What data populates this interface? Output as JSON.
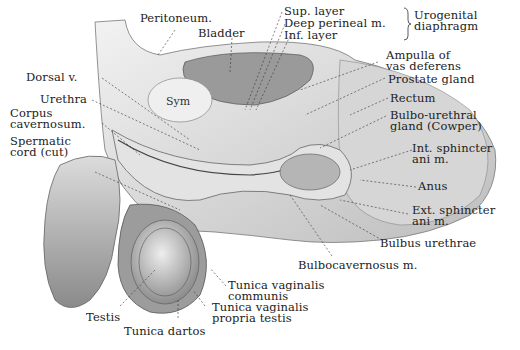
{
  "figure": {
    "labels": {
      "peritoneum": "Peritoneum.",
      "bladder": "Bladder",
      "sup_layer": "Sup. layer",
      "deep_perineal": "Deep perineal m.",
      "inf_layer": "Inf. layer",
      "urogenital_1": "Urogenital",
      "urogenital_2": "diaphragm",
      "ampulla_1": "Ampulla of",
      "ampulla_2": "vas deferens",
      "prostate": "Prostate gland",
      "rectum": "Rectum",
      "bulbo_1": "Bulbo-urethral",
      "bulbo_2": "gland (Cowper)",
      "int_sphincter_1": "Int. sphincter",
      "int_sphincter_2": "ani m.",
      "anus": "Anus",
      "ext_sphincter_1": "Ext. sphincter",
      "ext_sphincter_2": "ani m.",
      "bulbus_urethrae": "Bulbus urethrae",
      "bulbocavernosus": "Bulbocavernosus m.",
      "dorsal_v": "Dorsal v.",
      "urethra": "Urethra",
      "corpus_1": "Corpus",
      "corpus_2": "cavernosum.",
      "spermatic_1": "Spermatic",
      "spermatic_2": "cord (cut)",
      "sym": "Sym",
      "tv_communis_1": "Tunica vaginalis",
      "tv_communis_2": "communis",
      "tv_propria_1": "Tunica vaginalis",
      "tv_propria_2": "propria testis",
      "testis": "Testis",
      "tunica_dartos": "Tunica dartos"
    }
  }
}
